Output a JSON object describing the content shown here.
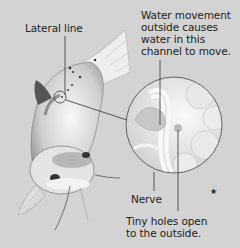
{
  "diagram": {
    "labels": {
      "lateral_line": "Lateral line",
      "water_movement": [
        "Water movement",
        "outside causes",
        "water in this",
        "channel to move."
      ],
      "nerve": "Nerve",
      "tiny_holes": [
        "Tiny holes open",
        "to the outside."
      ]
    },
    "colors": {
      "background": "#d3d3d3",
      "text": "#222222",
      "leader_lines": "#333333",
      "magnifier_border": "#444444"
    }
  }
}
